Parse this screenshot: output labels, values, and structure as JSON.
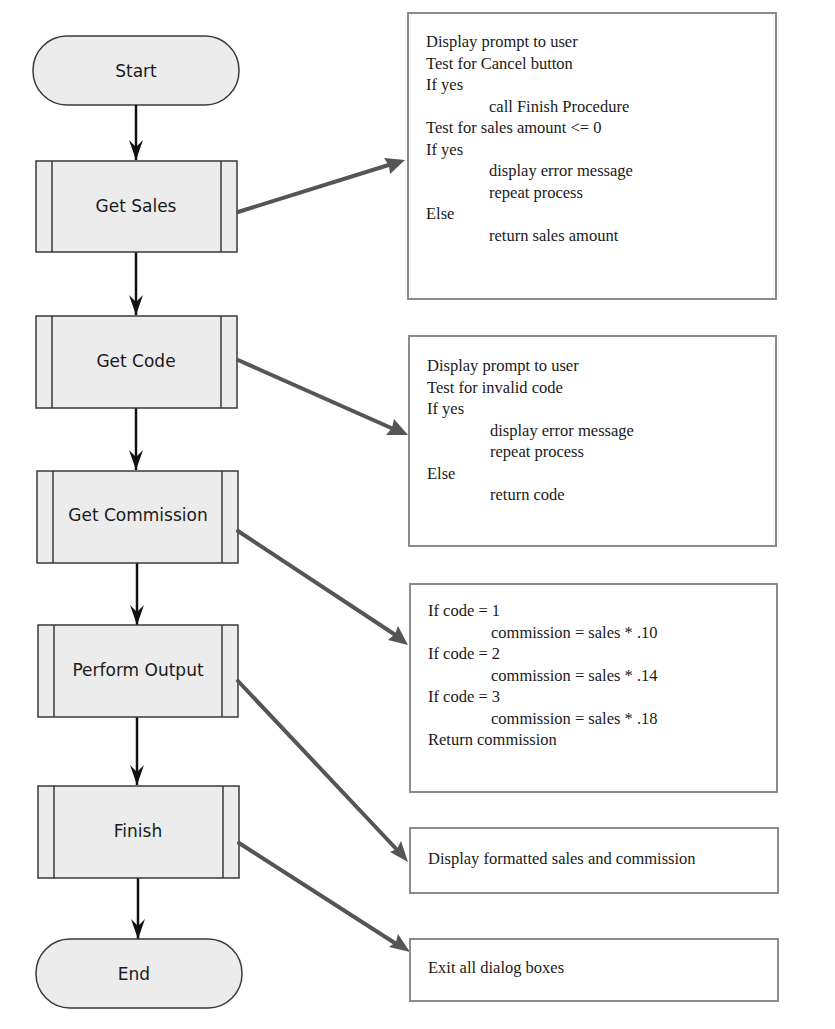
{
  "diagram": {
    "type": "flowchart",
    "colors": {
      "node_fill": "#ececec",
      "node_stroke": "#3a3a3a",
      "flow_arrow": "#111111",
      "link_arrow": "#555555",
      "box_border": "#8c8c8c"
    },
    "nodes": [
      {
        "id": "start",
        "shape": "terminal",
        "label": "Start"
      },
      {
        "id": "get-sales",
        "shape": "predefined-process",
        "label": "Get Sales"
      },
      {
        "id": "get-code",
        "shape": "predefined-process",
        "label": "Get Code"
      },
      {
        "id": "get-commission",
        "shape": "predefined-process",
        "label": "Get Commission"
      },
      {
        "id": "perform-output",
        "shape": "predefined-process",
        "label": "Perform Output"
      },
      {
        "id": "finish",
        "shape": "predefined-process",
        "label": "Finish"
      },
      {
        "id": "end",
        "shape": "terminal",
        "label": "End"
      }
    ],
    "flow_edges": [
      [
        "start",
        "get-sales"
      ],
      [
        "get-sales",
        "get-code"
      ],
      [
        "get-code",
        "get-commission"
      ],
      [
        "get-commission",
        "perform-output"
      ],
      [
        "perform-output",
        "finish"
      ],
      [
        "finish",
        "end"
      ]
    ],
    "pseudocode_boxes": [
      {
        "for": "get-sales",
        "lines": [
          {
            "text": "Display prompt to user",
            "indent": 0
          },
          {
            "text": "Test for Cancel button",
            "indent": 0
          },
          {
            "text": "If yes",
            "indent": 0
          },
          {
            "text": "call Finish Procedure",
            "indent": 1
          },
          {
            "text": "Test for sales amount <= 0",
            "indent": 0
          },
          {
            "text": "If yes",
            "indent": 0
          },
          {
            "text": "display error message",
            "indent": 1
          },
          {
            "text": "repeat process",
            "indent": 1
          },
          {
            "text": "Else",
            "indent": 0
          },
          {
            "text": "return sales amount",
            "indent": 1
          }
        ]
      },
      {
        "for": "get-code",
        "lines": [
          {
            "text": "Display prompt to user",
            "indent": 0
          },
          {
            "text": "Test for invalid code",
            "indent": 0
          },
          {
            "text": "If yes",
            "indent": 0
          },
          {
            "text": "display error message",
            "indent": 1
          },
          {
            "text": "repeat process",
            "indent": 1
          },
          {
            "text": "Else",
            "indent": 0
          },
          {
            "text": "return code",
            "indent": 1
          }
        ]
      },
      {
        "for": "get-commission",
        "lines": [
          {
            "text": "If code = 1",
            "indent": 0
          },
          {
            "text": "commission = sales * .10",
            "indent": 1
          },
          {
            "text": "If code = 2",
            "indent": 0
          },
          {
            "text": "commission = sales * .14",
            "indent": 1
          },
          {
            "text": "If code = 3",
            "indent": 0
          },
          {
            "text": "commission = sales * .18",
            "indent": 1
          },
          {
            "text": "Return commission",
            "indent": 0
          }
        ]
      },
      {
        "for": "perform-output",
        "lines": [
          {
            "text": "Display formatted sales and commission",
            "indent": 0
          }
        ]
      },
      {
        "for": "finish",
        "lines": [
          {
            "text": "Exit all dialog boxes",
            "indent": 0
          }
        ]
      }
    ]
  }
}
